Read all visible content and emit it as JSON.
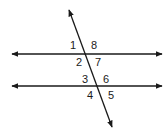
{
  "diagram": {
    "title": "",
    "stroke_color": "#1a1a1a",
    "lines": {
      "parallel_top": {
        "x1": 12,
        "y1": 54,
        "x2": 162,
        "y2": 54,
        "arrows": "both"
      },
      "parallel_bottom": {
        "x1": 12,
        "y1": 86,
        "x2": 162,
        "y2": 86,
        "arrows": "both"
      },
      "transversal": {
        "x1": 69,
        "y1": 10,
        "x2": 112,
        "y2": 127,
        "arrows": "both"
      }
    },
    "angles": [
      {
        "label": "1",
        "x": 70,
        "y": 49
      },
      {
        "label": "8",
        "x": 91,
        "y": 49
      },
      {
        "label": "2",
        "x": 76,
        "y": 66
      },
      {
        "label": "7",
        "x": 95,
        "y": 66
      },
      {
        "label": "3",
        "x": 82,
        "y": 83
      },
      {
        "label": "6",
        "x": 103,
        "y": 83
      },
      {
        "label": "4",
        "x": 87,
        "y": 99
      },
      {
        "label": "5",
        "x": 108,
        "y": 99
      }
    ]
  }
}
